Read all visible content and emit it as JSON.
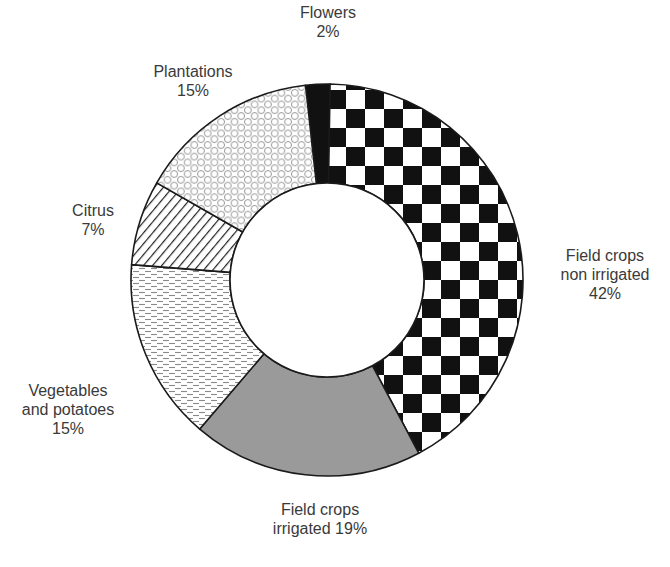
{
  "chart_data": {
    "type": "pie",
    "variant": "donut",
    "title": "",
    "start_angle_deg": -6.3,
    "direction": "clockwise",
    "center": [
      327,
      280
    ],
    "outer_radius": 196,
    "inner_radius": 97,
    "categories": [
      "Flowers",
      "Field crops non irrigated",
      "Field crops irrigated",
      "Vegetables and potatoes",
      "Citrus",
      "Plantations"
    ],
    "values": [
      2,
      42,
      19,
      15,
      7,
      15
    ],
    "unit": "%",
    "slices": [
      {
        "name": "Flowers",
        "value": 2,
        "fill": "solid-black",
        "label_lines": [
          "Flowers",
          "2%"
        ],
        "label_pos": [
          328,
          3
        ]
      },
      {
        "name": "Field crops non irrigated",
        "value": 42,
        "fill": "checkerboard",
        "label_lines": [
          "Field crops",
          "non irrigated",
          "42%"
        ],
        "label_pos": [
          605,
          246
        ]
      },
      {
        "name": "Field crops irrigated",
        "value": 19,
        "fill": "solid-gray",
        "label_lines": [
          "Field crops",
          "irrigated 19%"
        ],
        "label_pos": [
          320,
          500
        ]
      },
      {
        "name": "Vegetables and potatoes",
        "value": 15,
        "fill": "dashes",
        "label_lines": [
          "Vegetables",
          "and potatoes",
          "15%"
        ],
        "label_pos": [
          68,
          381
        ]
      },
      {
        "name": "Citrus",
        "value": 7,
        "fill": "diagonal-hatch",
        "label_lines": [
          "Citrus",
          "7%"
        ],
        "label_pos": [
          93,
          201
        ]
      },
      {
        "name": "Plantations",
        "value": 15,
        "fill": "hexagons",
        "label_lines": [
          "Plantations",
          "15%"
        ],
        "label_pos": [
          193,
          62
        ]
      }
    ],
    "legend": "none (direct labels)"
  },
  "colors": {
    "stroke": "#1a1a1a",
    "black": "#111111",
    "gray": "#9a9a9a",
    "pattern_line": "#8a8a8a",
    "label_text": "#3a3a3a",
    "background": "#ffffff"
  }
}
